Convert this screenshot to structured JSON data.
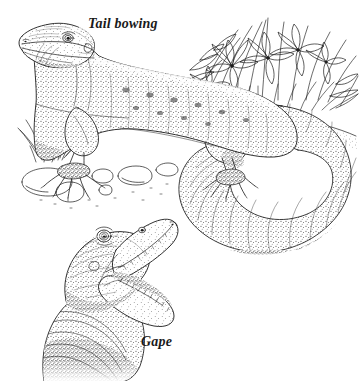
{
  "figure": {
    "medium": "pen-and-ink stipple illustration",
    "background_color": "#ffffff",
    "ink_color": "#1a1a1a",
    "width": 359,
    "height": 381
  },
  "captions": {
    "tail_bowing": "Tail bowing",
    "gape": "Gape"
  },
  "panels": [
    {
      "id": "tail-bowing-panel",
      "caption": "Tail bowing",
      "description": "Full-body lateral view of a monitor lizard standing on rocky ground, head raised, long tail swept around into a large closed loop behind the hindquarters.",
      "elements": [
        "lizard-head-raised",
        "lizard-body-stippled",
        "foreleg-front",
        "hindleg-rear",
        "tail-loop",
        "grass-tuft",
        "flowering-plants",
        "ground-rocks"
      ]
    },
    {
      "id": "gape-panel",
      "caption": "Gape",
      "description": "Close-up three-quarter view of the lizard's head and neck with the jaws opened wide, showing rows of small teeth and loose throat skin folds.",
      "elements": [
        "gape-head",
        "gape-open-jaws",
        "gape-teeth-row",
        "gape-eye",
        "gape-neck-folds"
      ]
    }
  ],
  "icons": {
    "eye_main": "lizard-eye-icon",
    "eye_gape": "lizard-eye-icon",
    "teeth": "teeth-row-icon"
  }
}
